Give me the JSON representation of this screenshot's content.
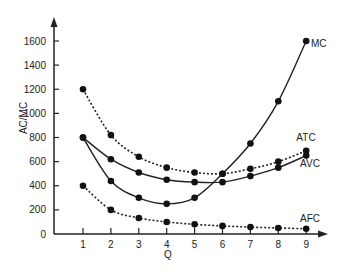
{
  "chart_data": {
    "type": "line",
    "title": "",
    "xlabel": "Q",
    "ylabel": "AC/MC",
    "x": [
      1,
      2,
      3,
      4,
      5,
      6,
      7,
      8,
      9
    ],
    "xticks": [
      "1",
      "2",
      "3",
      "4",
      "5",
      "6",
      "7",
      "8",
      "9"
    ],
    "yticks": [
      "0",
      "200",
      "400",
      "600",
      "800",
      "1000",
      "1200",
      "1400",
      "1600"
    ],
    "ylim": [
      0,
      1600
    ],
    "grid": false,
    "legend": "inline labels at line ends",
    "series": [
      {
        "name": "MC",
        "style": "solid",
        "values": [
          800,
          440,
          300,
          250,
          300,
          500,
          750,
          1100,
          1600
        ]
      },
      {
        "name": "ATC",
        "style": "dotted",
        "values": [
          1200,
          820,
          640,
          550,
          510,
          500,
          540,
          600,
          690
        ]
      },
      {
        "name": "AVC",
        "style": "solid",
        "values": [
          800,
          620,
          510,
          450,
          430,
          430,
          480,
          550,
          650
        ]
      },
      {
        "name": "AFC",
        "style": "dotted",
        "values": [
          400,
          200,
          133,
          100,
          80,
          67,
          57,
          50,
          44
        ]
      }
    ]
  },
  "axis": {
    "ylabel": "AC/MC",
    "xlabel": "Q"
  },
  "labels": {
    "mc": "MC",
    "atc": "ATC",
    "avc": "AVC",
    "afc": "AFC"
  }
}
